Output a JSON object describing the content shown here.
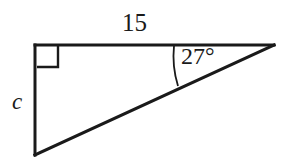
{
  "figure": {
    "background_color": "#ffffff",
    "stroke_color": "#1a1a1a"
  },
  "labels": {
    "top_side": "15",
    "left_side": "c",
    "angle": "27°"
  },
  "geometry": {
    "vertices": {
      "top_left": {
        "x": 35,
        "y": 45
      },
      "top_right": {
        "x": 274,
        "y": 45
      },
      "bottom_left": {
        "x": 35,
        "y": 155
      }
    },
    "right_angle_marker": {
      "at": "top_left",
      "size": 22
    },
    "angle_arc": {
      "at": "top_right",
      "measure_degrees": 27
    }
  }
}
